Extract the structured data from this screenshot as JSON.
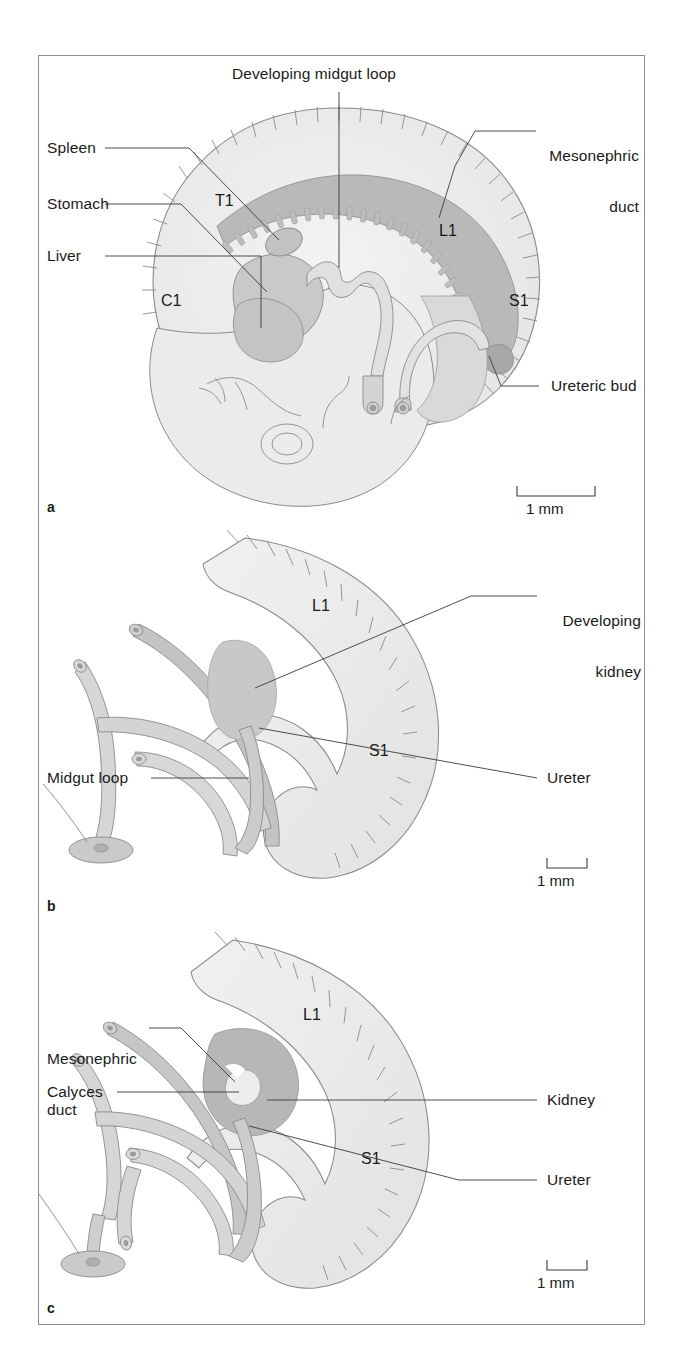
{
  "figure": {
    "type": "anatomical-diagram",
    "panel_count": 3,
    "colors": {
      "body_fill": "#ededed",
      "outline": "#7d7d7d",
      "organ_fill": "#c4c4c4",
      "duct_fill": "#b0b0b0",
      "tube_fill": "#d6d6d6",
      "leader_line": "#3a3a3a",
      "text": "#1a1a1a",
      "frame": "#8e8e8e",
      "background": "#ffffff"
    }
  },
  "panels": [
    {
      "letter": "a",
      "name": "panel-a",
      "scale_bar": {
        "label": "1 mm",
        "bar_width_px": 78
      },
      "vertebral_markers": [
        "C1",
        "T1",
        "L1",
        "S1"
      ],
      "labels": [
        {
          "id": "developing-midgut-loop",
          "text": "Developing midgut loop",
          "align": "center"
        },
        {
          "id": "mesonephric-duct",
          "text": "Mesonephric",
          "text2": "duct",
          "align": "right"
        },
        {
          "id": "spleen",
          "text": "Spleen",
          "align": "left"
        },
        {
          "id": "stomach",
          "text": "Stomach",
          "align": "left"
        },
        {
          "id": "liver",
          "text": "Liver",
          "align": "left"
        },
        {
          "id": "ureteric-bud",
          "text": "Ureteric bud",
          "align": "left"
        }
      ]
    },
    {
      "letter": "b",
      "name": "panel-b",
      "scale_bar": {
        "label": "1 mm",
        "bar_width_px": 40
      },
      "vertebral_markers": [
        "L1",
        "S1"
      ],
      "labels": [
        {
          "id": "developing-kidney",
          "text": "Developing",
          "text2": "kidney",
          "align": "right"
        },
        {
          "id": "midgut-loop",
          "text": "Midgut loop",
          "align": "left"
        },
        {
          "id": "ureter",
          "text": "Ureter",
          "align": "left"
        }
      ]
    },
    {
      "letter": "c",
      "name": "panel-c",
      "scale_bar": {
        "label": "1 mm",
        "bar_width_px": 40
      },
      "vertebral_markers": [
        "L1",
        "S1"
      ],
      "labels": [
        {
          "id": "mesonephric-duct",
          "text": "Mesonephric",
          "text2": "duct",
          "align": "left"
        },
        {
          "id": "calyces",
          "text": "Calyces",
          "align": "left"
        },
        {
          "id": "kidney",
          "text": "Kidney",
          "align": "left"
        },
        {
          "id": "ureter",
          "text": "Ureter",
          "align": "left"
        }
      ]
    }
  ],
  "text": {
    "a": {
      "letter": "a",
      "developing_midgut_loop": "Developing midgut loop",
      "mesonephric_1": "Mesonephric",
      "mesonephric_2": "duct",
      "spleen": "Spleen",
      "stomach": "Stomach",
      "liver": "Liver",
      "ureteric_bud": "Ureteric bud",
      "c1": "C1",
      "t1": "T1",
      "l1": "L1",
      "s1": "S1",
      "scale": "1 mm"
    },
    "b": {
      "letter": "b",
      "developing_1": "Developing",
      "developing_2": "kidney",
      "midgut_loop": "Midgut loop",
      "ureter": "Ureter",
      "l1": "L1",
      "s1": "S1",
      "scale": "1 mm"
    },
    "c": {
      "letter": "c",
      "mesonephric_1": "Mesonephric",
      "mesonephric_2": "duct",
      "calyces": "Calyces",
      "kidney": "Kidney",
      "ureter": "Ureter",
      "l1": "L1",
      "s1": "S1",
      "scale": "1 mm"
    }
  }
}
